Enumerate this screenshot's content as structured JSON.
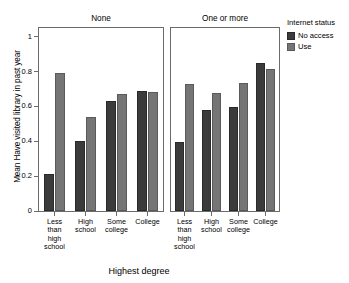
{
  "chart_data": {
    "type": "bar",
    "title": "",
    "xlabel": "Highest degree",
    "ylabel": "Mean Have visited library in past year",
    "ylim": [
      0,
      1.05
    ],
    "yticks": [
      0,
      0.2,
      0.4,
      0.6,
      0.8,
      1
    ],
    "ytick_labels": [
      "0",
      "0.2",
      "0.4",
      "0.6",
      "0.8",
      "1"
    ],
    "grid": false,
    "legend": {
      "title": "Internet status",
      "position": "right",
      "entries": [
        {
          "name": "No access",
          "color": "#3b3b3b"
        },
        {
          "name": "Use",
          "color": "#757575"
        }
      ]
    },
    "facet_variable": "Number of children",
    "categories": [
      "Less than high school",
      "High school",
      "Some college",
      "College"
    ],
    "category_labels": [
      "Less\nthan\nhigh\nschool",
      "High\nschool",
      "Some\ncollege",
      "College"
    ],
    "panels": [
      {
        "label": "None",
        "series": [
          {
            "name": "No access",
            "values": [
              0.215,
              0.403,
              0.63,
              0.687
            ]
          },
          {
            "name": "Use",
            "values": [
              0.79,
              0.541,
              0.671,
              0.685
            ]
          }
        ]
      },
      {
        "label": "One or more",
        "series": [
          {
            "name": "No access",
            "values": [
              0.397,
              0.577,
              0.596,
              0.851
            ]
          },
          {
            "name": "Use",
            "values": [
              0.731,
              0.676,
              0.736,
              0.813
            ]
          }
        ]
      }
    ]
  }
}
